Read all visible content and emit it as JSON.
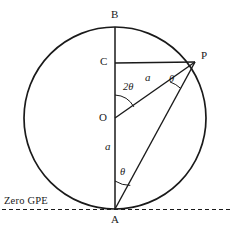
{
  "figure": {
    "background_color": "#ffffff",
    "stroke_color": "#1a1a1a",
    "canvas": {
      "width": 233,
      "height": 234
    },
    "circle": {
      "cx": 115,
      "cy": 118,
      "r": 91,
      "stroke_width": 1.6
    },
    "points": [
      {
        "name": "B",
        "label": "B",
        "x": 115,
        "y": 27,
        "label_x": 111,
        "label_y": 10
      },
      {
        "name": "C",
        "label": "C",
        "x": 115,
        "y": 63,
        "label_x": 101,
        "label_y": 57
      },
      {
        "name": "O",
        "label": "O",
        "x": 115,
        "y": 118,
        "label_x": 100,
        "label_y": 113
      },
      {
        "name": "P",
        "label": "P",
        "x": 195,
        "y": 62,
        "label_x": 201,
        "label_y": 51
      },
      {
        "name": "A",
        "label": "A",
        "x": 115,
        "y": 209,
        "label_x": 111,
        "label_y": 216
      }
    ],
    "segments": [
      {
        "name": "vertical-diameter-BA",
        "x1": 115,
        "y1": 27,
        "x2": 115,
        "y2": 209
      },
      {
        "name": "chord-CP",
        "x1": 115,
        "y1": 63,
        "x2": 195,
        "y2": 62
      },
      {
        "name": "radius-OP",
        "x1": 115,
        "y1": 118,
        "x2": 195,
        "y2": 62
      },
      {
        "name": "chord-PA",
        "x1": 195,
        "y1": 62,
        "x2": 115,
        "y2": 209
      }
    ],
    "labels": {
      "angle_center": "2θ",
      "angle_at_p": "θ",
      "angle_at_a": "θ",
      "radius_op": "a",
      "radius_oa": "a",
      "zero_gpe": "Zero GPE"
    },
    "label_positions": {
      "angle_center": {
        "x": 124,
        "y": 88
      },
      "angle_at_p": {
        "x": 168,
        "y": 79
      },
      "angle_at_a": {
        "x": 119,
        "y": 172
      },
      "radius_op": {
        "x": 145,
        "y": 78
      },
      "radius_oa": {
        "x": 106,
        "y": 146
      },
      "zero_gpe": {
        "x": 4,
        "y": 200
      }
    },
    "zero_gpe_line": {
      "y": 209,
      "x1": 2,
      "x2": 231,
      "dash": "4 3"
    }
  }
}
